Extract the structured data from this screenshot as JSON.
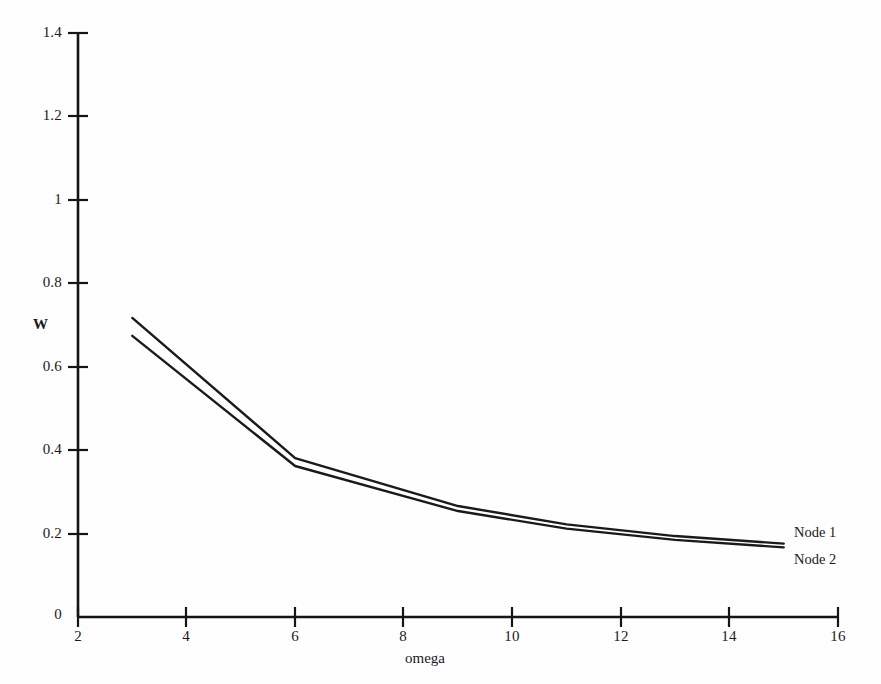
{
  "chart_data": {
    "type": "line",
    "title": "",
    "subtitle": "",
    "xlabel": "omega",
    "ylabel": "W",
    "xlim": [
      2,
      16
    ],
    "ylim": [
      0,
      1.4
    ],
    "xticks": [
      2,
      4,
      6,
      8,
      10,
      12,
      14,
      16
    ],
    "xtick_labels": [
      "2",
      "4",
      "6",
      "8",
      "10",
      "12",
      "14",
      "16"
    ],
    "yticks": [
      0,
      0.2,
      0.4,
      0.6,
      0.8,
      1,
      1.2,
      1.4
    ],
    "ytick_labels": [
      "0",
      "0.2",
      "0.4",
      "0.6",
      "0.8",
      "1",
      "1.2",
      "1.4"
    ],
    "grid": false,
    "legend_position": "inline-right-end",
    "line_color": "#1a1a1a",
    "background_color": "#fefefe",
    "x": [
      3,
      6,
      9,
      11,
      13,
      15
    ],
    "series": [
      {
        "name": "Node 1",
        "values": [
          0.717,
          0.381,
          0.266,
          0.222,
          0.194,
          0.176
        ]
      },
      {
        "name": "Node 2",
        "values": [
          0.674,
          0.362,
          0.254,
          0.212,
          0.185,
          0.167
        ]
      }
    ]
  },
  "axes": {
    "y_axis_name": "W",
    "x_axis_name": "omega"
  },
  "annotations": {
    "node1_label": "Node 1",
    "node2_label": "Node 2"
  }
}
